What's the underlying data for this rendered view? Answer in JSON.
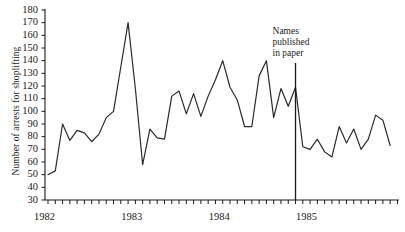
{
  "chart_data": {
    "type": "line",
    "title": "",
    "xlabel": "",
    "ylabel": "Number of arrests for shoplifting",
    "ylim": [
      30,
      180
    ],
    "ytick_labels": [
      "180",
      "170",
      "160",
      "150",
      "140",
      "130",
      "120",
      "110",
      "100",
      "90",
      "80",
      "70",
      "60",
      "50",
      "40",
      "30"
    ],
    "ytick_values": [
      180,
      170,
      160,
      150,
      140,
      130,
      120,
      110,
      100,
      90,
      80,
      70,
      60,
      50,
      40,
      30
    ],
    "xtick_labels": [
      "1982",
      "1983",
      "1984",
      "1985"
    ],
    "xtick_values": [
      1982,
      1983,
      1984,
      1985
    ],
    "x_minor_ticks_per_year": 12,
    "grid": false,
    "legend": null,
    "annotations": [
      {
        "name": "intervention-marker",
        "lines": [
          "Names",
          "published",
          "in paper"
        ],
        "x_index": 34,
        "type": "vertical-line-with-label"
      }
    ],
    "x": [
      "1982-01",
      "1982-02",
      "1982-03",
      "1982-04",
      "1982-05",
      "1982-06",
      "1982-07",
      "1982-08",
      "1982-09",
      "1982-10",
      "1982-11",
      "1982-12",
      "1983-01",
      "1983-02",
      "1983-03",
      "1983-04",
      "1983-05",
      "1983-06",
      "1983-07",
      "1983-08",
      "1983-09",
      "1983-10",
      "1983-11",
      "1983-12",
      "1984-01",
      "1984-02",
      "1984-03",
      "1984-04",
      "1984-05",
      "1984-06",
      "1984-07",
      "1984-08",
      "1984-09",
      "1984-10",
      "1984-11",
      "1984-12",
      "1985-01",
      "1985-02",
      "1985-03",
      "1985-04",
      "1985-05",
      "1985-06",
      "1985-07",
      "1985-08",
      "1985-09",
      "1985-10",
      "1985-11",
      "1985-12"
    ],
    "values": [
      50,
      53,
      90,
      77,
      85,
      83,
      76,
      82,
      95,
      100,
      135,
      170,
      118,
      58,
      86,
      79,
      78,
      112,
      116,
      98,
      114,
      96,
      112,
      125,
      140,
      119,
      109,
      88,
      88,
      128,
      140,
      95,
      118,
      104,
      119,
      72,
      70,
      78,
      68,
      64,
      88,
      75,
      86,
      70,
      78,
      97,
      93,
      73
    ],
    "series_name": "Arrests for shoplifting",
    "line_color": "#2b2b2b"
  }
}
